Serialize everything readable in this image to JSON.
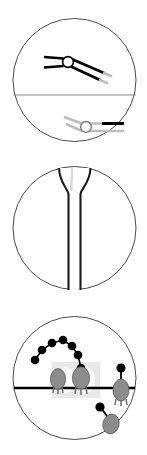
{
  "figure": {
    "panel_count": 3,
    "background_color": "#ffffff",
    "outline_color": "#4a4a4a",
    "panels": [
      {
        "id": "panel-1",
        "name": "antibody-binding-panel",
        "shape": "circle",
        "circle": {
          "cx": 74.5,
          "cy": 80,
          "r": 61.5
        },
        "divider_line": {
          "y": 95,
          "color": "#8a8a8a",
          "width": 1
        },
        "elements": [
          {
            "name": "antibody-black",
            "color": "#000000",
            "hinge": {
              "cx": 68,
              "cy": 62,
              "r": 5.5,
              "fill": "#ffffff",
              "stroke": "#000000"
            },
            "arms": "two-pronged-fork-left, two-long-arms-right-down"
          },
          {
            "name": "antibody-gray",
            "color": "#bdbdbd",
            "hinge": {
              "cx": 86,
              "cy": 127,
              "r": 5.5,
              "fill": "#ffffff",
              "stroke": "#9a9a9a"
            },
            "bar_segment": {
              "color": "#000000",
              "note": "black bar on upper right arm"
            }
          }
        ]
      },
      {
        "id": "panel-2",
        "name": "funnel-tube-panel",
        "shape": "circle",
        "circle": {
          "cx": 74.5,
          "cy": 228,
          "r": 61.5
        },
        "elements": [
          {
            "name": "funnel-pipette",
            "color": "#1a1a1a",
            "stem": {
              "x_left": 68,
              "x_right": 80,
              "y_top": 192,
              "y_bottom": 290
            },
            "flare": "top opens outward to circle edge"
          }
        ]
      },
      {
        "id": "panel-3",
        "name": "membrane-receptor-panel",
        "shape": "circle",
        "circle": {
          "cx": 74.5,
          "cy": 378,
          "r": 61.5
        },
        "membrane_line": {
          "y": 388,
          "color": "#000000",
          "width": 2.6
        },
        "watermark": {
          "color": "#e3e3e3",
          "x": 52,
          "y": 362,
          "w": 48,
          "h": 36
        },
        "bead_chain": {
          "name": "bead-chain",
          "count": 7,
          "color": "#000000",
          "points": [
            [
              35,
              360
            ],
            [
              42,
              350
            ],
            [
              52,
              343
            ],
            [
              63,
              340
            ],
            [
              72,
              346
            ],
            [
              78,
              355
            ],
            [
              81,
              368
            ]
          ]
        },
        "receptors": [
          {
            "name": "receptor-left",
            "cx": 58,
            "cy": 379,
            "rx": 7.5,
            "ry": 10,
            "fill": "#8c8c8c",
            "legs": 3
          },
          {
            "name": "receptor-mid",
            "cx": 81,
            "cy": 379,
            "rx": 8.5,
            "ry": 11,
            "fill": "#8c8c8c",
            "legs": 3
          },
          {
            "name": "receptor-right",
            "cx": 121,
            "cy": 390,
            "rx": 8,
            "ry": 11,
            "fill": "#8c8c8c",
            "legs": 3,
            "stalk_bead": {
              "cx": 121,
              "cy": 368,
              "r": 4.5,
              "color": "#000000"
            }
          },
          {
            "name": "receptor-bottom",
            "cx": 110,
            "cy": 422,
            "rx": 8,
            "ry": 10,
            "fill": "#8c8c8c",
            "legs": 0,
            "stalk_bead": {
              "cx": 100,
              "cy": 407,
              "r": 4.5,
              "color": "#000000"
            }
          }
        ]
      }
    ]
  },
  "colors": {
    "outline": "#4a4a4a",
    "divider": "#8a8a8a",
    "black": "#000000",
    "gray_arm": "#bdbdbd",
    "receptor_gray": "#8c8c8c",
    "watermark": "#e3e3e3",
    "membrane": "#000000",
    "white": "#ffffff"
  }
}
